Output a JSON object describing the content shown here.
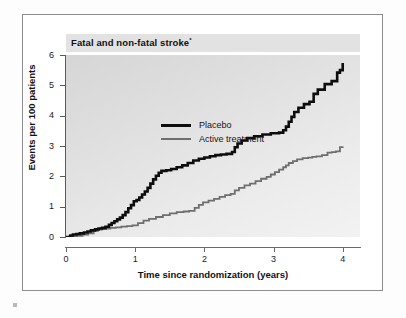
{
  "figure": {
    "title": "Fatal and non-fatal stroke",
    "title_superscript": "*"
  },
  "axes": {
    "y_title": "Events per 100 patients",
    "x_title": "Time since randomization (years)",
    "y_ticks": [
      "0",
      "1",
      "2",
      "3",
      "4",
      "5",
      "6"
    ],
    "x_ticks": [
      "0",
      "1",
      "2",
      "3",
      "4"
    ]
  },
  "legend": {
    "entries": [
      {
        "label": "Placebo",
        "color": "#0d0d0d",
        "width": 2.6
      },
      {
        "label": "Active treatment",
        "color": "#6e6e6e",
        "width": 1.8
      }
    ]
  },
  "colors": {
    "placebo": "#0d0d0d",
    "active_treatment": "#6e6e6e",
    "plot_background_top": "#d6d6d6",
    "plot_background_bottom": "#f2f2f2",
    "title_band": "#e2e2e2",
    "frame_border": "#8d8d8d",
    "axis": "#5a5a5a"
  },
  "chart_data": {
    "type": "line",
    "title": "Fatal and non-fatal stroke*",
    "xlabel": "Time since randomization (years)",
    "ylabel": "Events per 100 patients",
    "xlim": [
      0,
      4.25
    ],
    "ylim": [
      0,
      6
    ],
    "grid": false,
    "legend_position": "top-left-inside",
    "step_style": "post",
    "series": [
      {
        "name": "Placebo",
        "color": "#0d0d0d",
        "x": [
          0.0,
          0.06,
          0.1,
          0.15,
          0.2,
          0.26,
          0.31,
          0.36,
          0.42,
          0.47,
          0.52,
          0.57,
          0.62,
          0.66,
          0.7,
          0.74,
          0.78,
          0.82,
          0.86,
          0.9,
          0.94,
          0.98,
          1.02,
          1.06,
          1.1,
          1.14,
          1.18,
          1.22,
          1.26,
          1.3,
          1.34,
          1.38,
          1.45,
          1.52,
          1.6,
          1.68,
          1.76,
          1.84,
          1.92,
          2.0,
          2.08,
          2.16,
          2.24,
          2.32,
          2.4,
          2.44,
          2.48,
          2.54,
          2.62,
          2.72,
          2.84,
          2.96,
          3.08,
          3.14,
          3.18,
          3.22,
          3.26,
          3.3,
          3.36,
          3.44,
          3.52,
          3.58,
          3.64,
          3.74,
          3.84,
          3.92,
          3.96,
          4.0
        ],
        "y": [
          0.0,
          0.05,
          0.08,
          0.1,
          0.12,
          0.15,
          0.18,
          0.22,
          0.25,
          0.28,
          0.3,
          0.34,
          0.4,
          0.46,
          0.52,
          0.58,
          0.64,
          0.72,
          0.82,
          0.95,
          1.05,
          1.18,
          1.22,
          1.3,
          1.4,
          1.5,
          1.62,
          1.76,
          1.9,
          2.02,
          2.12,
          2.18,
          2.2,
          2.24,
          2.3,
          2.36,
          2.44,
          2.52,
          2.58,
          2.62,
          2.66,
          2.7,
          2.72,
          2.74,
          2.8,
          2.96,
          3.08,
          3.18,
          3.26,
          3.32,
          3.38,
          3.42,
          3.44,
          3.52,
          3.64,
          3.8,
          3.96,
          4.12,
          4.26,
          4.38,
          4.46,
          4.72,
          4.86,
          5.04,
          5.14,
          5.42,
          5.5,
          5.74
        ]
      },
      {
        "name": "Active treatment",
        "color": "#6e6e6e",
        "x": [
          0.0,
          0.08,
          0.16,
          0.24,
          0.32,
          0.4,
          0.46,
          0.52,
          0.58,
          0.64,
          0.72,
          0.8,
          0.88,
          0.96,
          1.04,
          1.12,
          1.2,
          1.3,
          1.4,
          1.5,
          1.6,
          1.7,
          1.78,
          1.86,
          1.92,
          1.98,
          2.06,
          2.14,
          2.22,
          2.3,
          2.38,
          2.44,
          2.5,
          2.58,
          2.66,
          2.74,
          2.82,
          2.9,
          2.96,
          3.02,
          3.08,
          3.14,
          3.18,
          3.22,
          3.28,
          3.34,
          3.42,
          3.5,
          3.56,
          3.62,
          3.7,
          3.78,
          3.84,
          3.9,
          3.96,
          4.0
        ],
        "y": [
          0.0,
          0.02,
          0.04,
          0.08,
          0.12,
          0.2,
          0.24,
          0.26,
          0.28,
          0.3,
          0.32,
          0.34,
          0.36,
          0.38,
          0.46,
          0.54,
          0.6,
          0.66,
          0.72,
          0.78,
          0.82,
          0.84,
          0.86,
          0.96,
          1.06,
          1.14,
          1.2,
          1.26,
          1.32,
          1.38,
          1.42,
          1.54,
          1.62,
          1.7,
          1.76,
          1.84,
          1.92,
          1.98,
          2.06,
          2.14,
          2.22,
          2.3,
          2.36,
          2.44,
          2.5,
          2.56,
          2.6,
          2.62,
          2.64,
          2.66,
          2.7,
          2.78,
          2.8,
          2.82,
          2.96,
          2.98
        ]
      }
    ]
  }
}
